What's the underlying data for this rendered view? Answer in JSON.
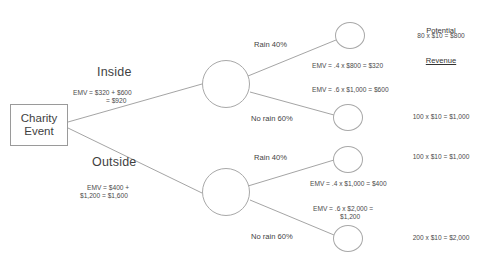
{
  "diagram": {
    "root": {
      "line1": "Charity",
      "line2": "Event"
    },
    "decisions": [
      {
        "name": "Inside",
        "emv_line1": "EMV = $320 + $600",
        "emv_line2": "= $920"
      },
      {
        "name": "Outside",
        "emv_line1": "EMV = $400 +",
        "emv_line2": "$1,200 = $1,600"
      }
    ],
    "outcomes": [
      {
        "probability_label": "Rain 40%",
        "emv": "EMV = .4 x $800 = $320",
        "emv_line2": ""
      },
      {
        "probability_label": "No rain 60%",
        "emv": "EMV = .6 x $1,000 = $600",
        "emv_line2": ""
      },
      {
        "probability_label": "Rain 40%",
        "emv": "EMV = .4 x $1,000 = $400",
        "emv_line2": ""
      },
      {
        "probability_label": "No rain 60%",
        "emv": "EMV = .6 x $2,000 =",
        "emv_line2": "$1,200"
      }
    ],
    "revenue_column": {
      "header_line1": "Potential",
      "header_line2": "Revenue",
      "values": [
        "80 x $10 = $800",
        "100 x $10 = $1,000",
        "100 x $10 = $1,000",
        "200 x $10 = $2,000"
      ]
    },
    "colors": {
      "stroke": "#9a9a9a",
      "text": "#3f3f3f",
      "background": "#ffffff"
    }
  }
}
